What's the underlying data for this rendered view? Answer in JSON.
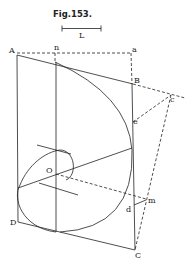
{
  "figure": {
    "title": "Fig.153.",
    "scale_label": "L"
  },
  "points": {
    "A": "A",
    "n": "n",
    "a": "a",
    "B": "B",
    "c": "c",
    "e": "e",
    "O": "O",
    "D": "D",
    "m": "m",
    "d": "d",
    "C": "C"
  },
  "colors": {
    "ink": "#222222",
    "background": "#ffffff"
  }
}
